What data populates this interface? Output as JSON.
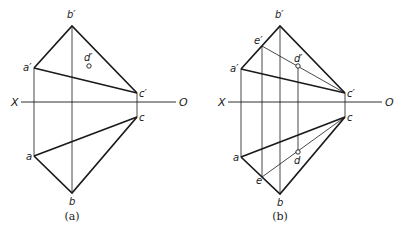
{
  "colors": {
    "stroke": "#1a1a1a",
    "background": "#ffffff"
  },
  "figures": [
    {
      "caption": "(a)",
      "axis": {
        "x_label": "X",
        "o_label": "O"
      },
      "points": {
        "b_prime": "b′",
        "a_prime": "a′",
        "c_prime": "c′",
        "d_prime": "d′",
        "a": "a",
        "b": "b",
        "c": "c"
      }
    },
    {
      "caption": "(b)",
      "axis": {
        "x_label": "X",
        "o_label": "O"
      },
      "points": {
        "b_prime": "b′",
        "a_prime": "a′",
        "c_prime": "c′",
        "d_prime": "d′",
        "e_prime": "e′",
        "a": "a",
        "b": "b",
        "c": "c",
        "d": "d",
        "e": "e"
      }
    }
  ]
}
